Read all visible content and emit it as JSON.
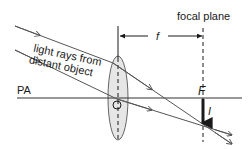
{
  "diagram": {
    "labels": {
      "focal_plane": "focal plane",
      "focal_length": "f",
      "principal_axis": "PA",
      "focal_point": "F",
      "image": "I",
      "rays_line1": "light rays from",
      "rays_line2": "distant object"
    },
    "colors": {
      "line": "#1a1a1a",
      "ray": "#555555",
      "lens_fill": "#e6e6e6",
      "lens_stroke": "#666666"
    }
  }
}
